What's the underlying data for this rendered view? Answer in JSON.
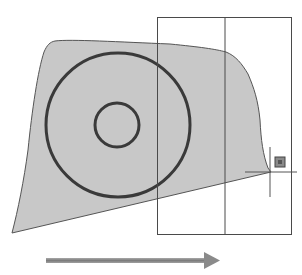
{
  "diagram": {
    "colors": {
      "background": "#ffffff",
      "region_fill": "#c8c8c8",
      "region_stroke": "#555555",
      "circle_stroke": "#3a3a3a",
      "window_stroke": "#4a4a4a",
      "crosshair": "#555555",
      "grip_fill": "#777777",
      "arrow": "#8a8a8a"
    },
    "elements": {
      "region": "filled-region",
      "outer_circle": "outer-circle",
      "inner_circle": "inner-circle",
      "selection_window": "selection-window",
      "crosshair_cursor": "crosshair-cursor",
      "grip": "grip-square",
      "direction_arrow": "direction-arrow-right"
    }
  }
}
